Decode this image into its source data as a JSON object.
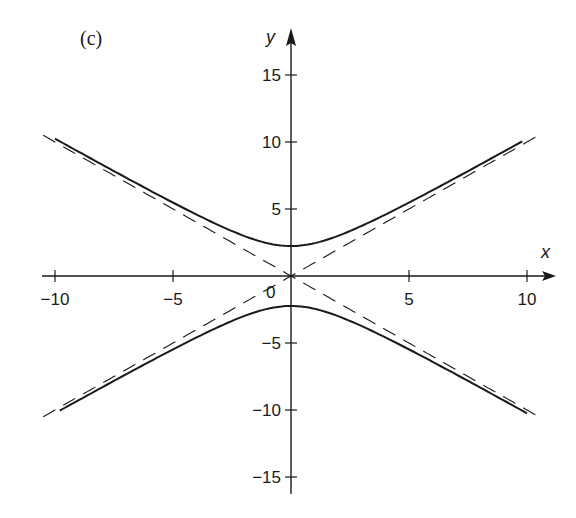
{
  "chart_data": {
    "type": "line",
    "title": "",
    "panel_label": "(c)",
    "xlabel": "x",
    "ylabel": "y",
    "xlim": [
      -10.5,
      11
    ],
    "ylim": [
      -16.5,
      17.5
    ],
    "x_ticks": [
      -10,
      -5,
      0,
      5,
      10
    ],
    "x_tick_labels": [
      "−10",
      "−5",
      "0",
      "5",
      "10"
    ],
    "y_ticks": [
      -15,
      -10,
      -5,
      5,
      10,
      15
    ],
    "y_tick_labels": [
      "−15",
      "−10",
      "−5",
      "5",
      "10",
      "15"
    ],
    "origin_label": "0",
    "grid": false,
    "legend": null,
    "series": [
      {
        "name": "hyperbola upper branch",
        "style": "solid",
        "equation": "y = sqrt(x^2 + 5)",
        "x_range": [
          -10,
          9.8
        ]
      },
      {
        "name": "hyperbola lower branch",
        "style": "solid",
        "equation": "y = -sqrt(x^2 + 5)",
        "x_range": [
          -9.8,
          10
        ]
      },
      {
        "name": "asymptote y = x",
        "style": "dashed",
        "equation": "y = x",
        "x_range": [
          -10.5,
          10.5
        ]
      },
      {
        "name": "asymptote y = -x",
        "style": "dashed",
        "equation": "y = -x",
        "x_range": [
          -10.5,
          10.5
        ]
      }
    ],
    "sample_points_upper": [
      [
        -10,
        10.25
      ],
      [
        -5,
        5.48
      ],
      [
        0,
        2.24
      ],
      [
        5,
        5.48
      ],
      [
        10,
        10.25
      ]
    ],
    "sample_points_lower": [
      [
        -10,
        -10.25
      ],
      [
        -5,
        -5.48
      ],
      [
        0,
        -2.24
      ],
      [
        5,
        -5.48
      ],
      [
        10,
        -10.25
      ]
    ]
  }
}
